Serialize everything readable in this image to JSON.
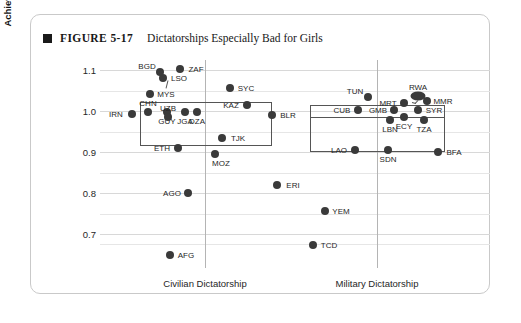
{
  "figure": {
    "bullet_icon": "black-square-bullet",
    "number": "FIGURE 5-17",
    "title": "Dictatorships Especially Bad for Girls"
  },
  "chart_data": {
    "type": "scatter",
    "title": "Dictatorships Especially Bad for Girls",
    "xlabel": "",
    "ylabel": "Ratio of Girls-to-Boys Educational Achievement",
    "ylim": [
      0.65,
      1.125
    ],
    "yticks": [
      "1.1",
      "1.0",
      "0.9",
      "0.8",
      "0.7"
    ],
    "ytick_values": [
      1.1,
      1.0,
      0.9,
      0.8,
      0.7
    ],
    "minor_gridlines": [
      1.05,
      0.95,
      0.85,
      0.75,
      0.675
    ],
    "grid": true,
    "legend": "none",
    "groups": [
      {
        "name": "Civilian Dictatorship",
        "axis_label": "Civilian Dictatorship",
        "center_x": 205,
        "box": {
          "x1": 140,
          "y1": 102,
          "x2": 272,
          "y2": 146
        },
        "points": [
          {
            "code": "IRN",
            "x": 132,
            "y": 114,
            "value": 0.995,
            "label_pos": "left"
          },
          {
            "code": "CHN",
            "x": 148,
            "y": 112,
            "value": 1.005,
            "label_pos": "above"
          },
          {
            "code": "GUY",
            "x": 167,
            "y": 112,
            "value": 1.005,
            "label_pos": "below"
          },
          {
            "code": "UZB",
            "x": 168,
            "y": 117,
            "value": 0.985,
            "label_pos": "above"
          },
          {
            "code": "JGA",
            "x": 185,
            "y": 112,
            "value": 1.005,
            "label_pos": "below"
          },
          {
            "code": "DZA",
            "x": 197,
            "y": 112,
            "value": 1.005,
            "label_pos": "below"
          },
          {
            "code": "KAZ",
            "x": 247,
            "y": 105,
            "value": 1.02,
            "label_pos": "left"
          },
          {
            "code": "BLR",
            "x": 272,
            "y": 115,
            "value": 0.99,
            "label_pos": "right"
          },
          {
            "code": "MYS",
            "x": 150,
            "y": 94,
            "value": 1.045,
            "label_pos": "right"
          },
          {
            "code": "LSO",
            "x": 163,
            "y": 78,
            "value": 1.085,
            "label_pos": "right"
          },
          {
            "code": "BGD",
            "x": 160,
            "y": 72,
            "value": 1.1,
            "label_pos": "above-left"
          },
          {
            "code": "ZAF",
            "x": 180,
            "y": 69,
            "value": 1.105,
            "label_pos": "right"
          },
          {
            "code": "SYC",
            "x": 230,
            "y": 88,
            "value": 1.06,
            "label_pos": "right"
          },
          {
            "code": "TJK",
            "x": 222,
            "y": 138,
            "value": 0.935,
            "label_pos": "right"
          },
          {
            "code": "ETH",
            "x": 178,
            "y": 148,
            "value": 0.91,
            "label_pos": "left"
          },
          {
            "code": "MOZ",
            "x": 215,
            "y": 154,
            "value": 0.895,
            "label_pos": "below-right"
          },
          {
            "code": "AGO",
            "x": 188,
            "y": 193,
            "value": 0.8,
            "label_pos": "left"
          },
          {
            "code": "ERI",
            "x": 277,
            "y": 185,
            "value": 0.82,
            "label_pos": "right"
          },
          {
            "code": "AFG",
            "x": 170,
            "y": 255,
            "value": 0.665,
            "label_pos": "right"
          }
        ]
      },
      {
        "name": "Military Dictatorship",
        "axis_label": "Military Dictatorship",
        "center_x": 377,
        "box": {
          "x1": 310,
          "y1": 105,
          "x2": 445,
          "y2": 152
        },
        "box_inner_line_y": 117,
        "points": [
          {
            "code": "TUN",
            "x": 368,
            "y": 97,
            "value": 1.04,
            "label_pos": "above-left"
          },
          {
            "code": "CUB",
            "x": 358,
            "y": 110,
            "value": 1.0,
            "label_pos": "left"
          },
          {
            "code": "GMB",
            "x": 394,
            "y": 110,
            "value": 1.0,
            "label_pos": "left"
          },
          {
            "code": "MRT",
            "x": 404,
            "y": 103,
            "value": 1.018,
            "label_pos": "left"
          },
          {
            "code": "RWA",
            "x": 418,
            "y": 96,
            "value": 1.042,
            "label_pos": "above"
          },
          {
            "code": "MMR",
            "x": 427,
            "y": 101,
            "value": 1.025,
            "label_pos": "right"
          },
          {
            "code": "SYR",
            "x": 418,
            "y": 110,
            "value": 1.0,
            "label_pos": "right"
          },
          {
            "code": "LBN",
            "x": 390,
            "y": 120,
            "value": 0.975,
            "label_pos": "below"
          },
          {
            "code": "ECY",
            "x": 404,
            "y": 117,
            "value": 0.985,
            "label_pos": "below"
          },
          {
            "code": "TZA",
            "x": 424,
            "y": 120,
            "value": 0.975,
            "label_pos": "below"
          },
          {
            "code": "LAO",
            "x": 355,
            "y": 150,
            "value": 0.9,
            "label_pos": "left"
          },
          {
            "code": "SDN",
            "x": 388,
            "y": 150,
            "value": 0.9,
            "label_pos": "below"
          },
          {
            "code": "BFA",
            "x": 438,
            "y": 152,
            "value": 0.895,
            "label_pos": "right"
          },
          {
            "code": "YEM",
            "x": 325,
            "y": 211,
            "value": 0.76,
            "label_pos": "right"
          },
          {
            "code": "TCD",
            "x": 313,
            "y": 245,
            "value": 0.69,
            "label_pos": "right"
          }
        ]
      }
    ]
  },
  "colors": {
    "point": "#3a3a3a",
    "gridline": "#d8d8d8",
    "box_border": "#555555",
    "card_border": "#c9c9c9",
    "text": "#262626"
  }
}
